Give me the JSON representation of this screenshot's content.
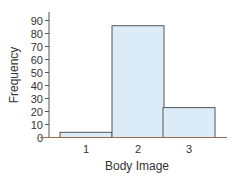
{
  "chart_data": {
    "type": "bar",
    "title": "",
    "xlabel": "Body Image",
    "ylabel": "Frequency",
    "categories": [
      "1",
      "2",
      "3"
    ],
    "values": [
      4,
      86,
      23
    ],
    "ylim": [
      0,
      95
    ],
    "yticks": [
      0,
      10,
      20,
      30,
      40,
      50,
      60,
      70,
      80,
      90
    ],
    "grid": false,
    "legend": null,
    "bar_fill": "#dcebf8",
    "bar_stroke": "#555555",
    "axis_color": "#555555",
    "baseline_color": "#9a6a4a"
  }
}
